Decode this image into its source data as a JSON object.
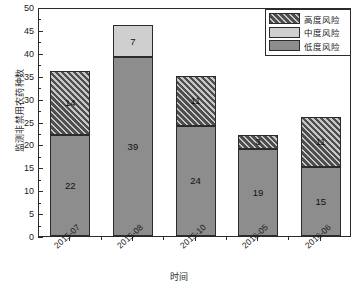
{
  "chart_data": {
    "type": "bar",
    "subtype": "stacked-bar",
    "title": "",
    "xlabel": "时间",
    "ylabel": "监测非禁用农药种数",
    "categories": [
      "2015-07",
      "2015-08",
      "2015-10",
      "2016-05",
      "2016-06"
    ],
    "series": [
      {
        "name": "低度风险",
        "color": "#8d8d8d",
        "pattern": "solid",
        "values": [
          22,
          39,
          24,
          19,
          15
        ]
      },
      {
        "name": "中度风险",
        "color": "#cfcfcf",
        "pattern": "solid",
        "values": [
          0,
          7,
          0,
          0,
          0
        ]
      },
      {
        "name": "高度风险",
        "color": "#4e4e4e",
        "pattern": "diagonal-hatch",
        "values": [
          14,
          0,
          11,
          3,
          11
        ]
      }
    ],
    "totals": [
      36,
      46,
      35,
      22,
      26
    ],
    "ylim": [
      0,
      50
    ],
    "ytick_step": 5,
    "ytick_labels": [
      "0",
      "5",
      "10",
      "15",
      "20",
      "25",
      "30",
      "35",
      "40",
      "45",
      "50"
    ],
    "minor_ticks": true,
    "grid": false,
    "legend_position": "top-right",
    "bar_labels_shown": true
  },
  "axes": {
    "y_title": "监测非禁用农药种数",
    "x_title": "时间"
  },
  "legend": {
    "entries": [
      {
        "label": "高度风险"
      },
      {
        "label": "中度风险"
      },
      {
        "label": "低度风险"
      }
    ]
  },
  "bars": [
    {
      "category": "2015-07",
      "segments": [
        {
          "series": "低度风险",
          "value": 22,
          "label": "22"
        },
        {
          "series": "高度风险",
          "value": 14,
          "label": "14"
        }
      ]
    },
    {
      "category": "2015-08",
      "segments": [
        {
          "series": "低度风险",
          "value": 39,
          "label": "39"
        },
        {
          "series": "中度风险",
          "value": 7,
          "label": "7"
        }
      ]
    },
    {
      "category": "2015-10",
      "segments": [
        {
          "series": "低度风险",
          "value": 24,
          "label": "24"
        },
        {
          "series": "高度风险",
          "value": 11,
          "label": "11"
        }
      ]
    },
    {
      "category": "2016-05",
      "segments": [
        {
          "series": "低度风险",
          "value": 19,
          "label": "19"
        },
        {
          "series": "高度风险",
          "value": 3,
          "label": "3"
        }
      ]
    },
    {
      "category": "2016-06",
      "segments": [
        {
          "series": "低度风险",
          "value": 15,
          "label": "15"
        },
        {
          "series": "高度风险",
          "value": 11,
          "label": "11"
        }
      ]
    }
  ],
  "colors": {
    "low_risk": "#8d8d8d",
    "mid_risk": "#cfcfcf",
    "high_risk": "#4e4e4e",
    "axis": "#2b2b2b",
    "background": "#ffffff"
  }
}
